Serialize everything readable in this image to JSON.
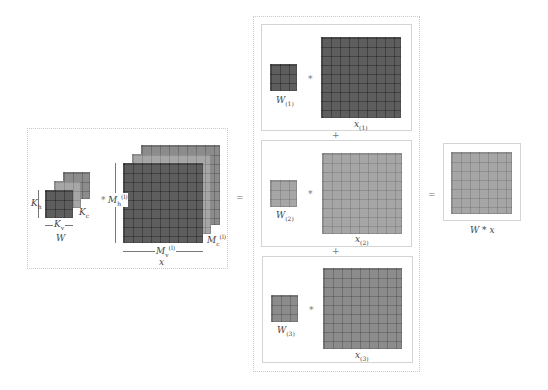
{
  "figure": {
    "left_panel": {
      "kernel_label": "W",
      "kernel_height_label": "K",
      "kernel_height_sub": "h",
      "kernel_width_label": "K",
      "kernel_width_sub": "v",
      "kernel_channels_label": "K",
      "kernel_channels_sub": "c",
      "conv_operator": "*",
      "input_label": "x",
      "input_height_label": "M",
      "input_height_sub": "h",
      "input_height_sup": "(l)",
      "input_width_label": "M",
      "input_width_sub": "v",
      "input_width_sup": "(l)",
      "input_channels_label": "M",
      "input_channels_sub": "c",
      "input_channels_sup": "(l)"
    },
    "equals_1": "=",
    "middle_panel": {
      "plus": "+",
      "rows": [
        {
          "kernel_label": "W",
          "kernel_sub": "(1)",
          "operator": "*",
          "input_label": "x",
          "input_sub": "(1)",
          "shade": "dark"
        },
        {
          "kernel_label": "W",
          "kernel_sub": "(2)",
          "operator": "*",
          "input_label": "x",
          "input_sub": "(2)",
          "shade": "light"
        },
        {
          "kernel_label": "W",
          "kernel_sub": "(3)",
          "operator": "*",
          "input_label": "x",
          "input_sub": "(3)",
          "shade": "mid"
        }
      ]
    },
    "equals_2": "=",
    "right_panel": {
      "output_label": "W * x"
    },
    "colors": {
      "dark": "#5e5e5e",
      "mid": "#8c8c8c",
      "light": "#a6a6a6"
    }
  }
}
